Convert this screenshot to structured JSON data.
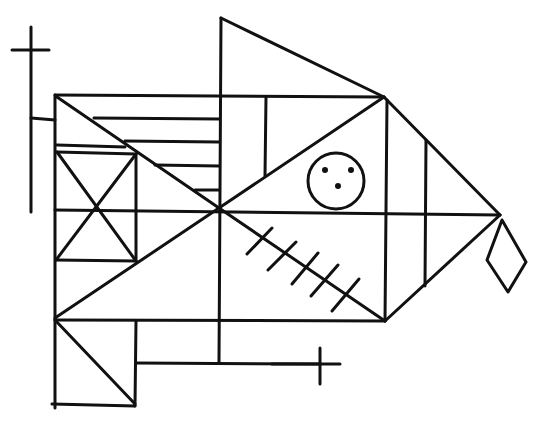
{
  "drawing": {
    "subject": "geometric fish",
    "stroke_color": "#111111",
    "background_color": "#ffffff",
    "eye": {
      "cx": 336,
      "cy": 181,
      "r": 28,
      "dots": [
        [
          325,
          170
        ],
        [
          350,
          170
        ],
        [
          337,
          186
        ]
      ]
    },
    "marks": {
      "cross_top_left": "plus",
      "cross_bottom": "plus",
      "hatch_count": 5
    }
  }
}
